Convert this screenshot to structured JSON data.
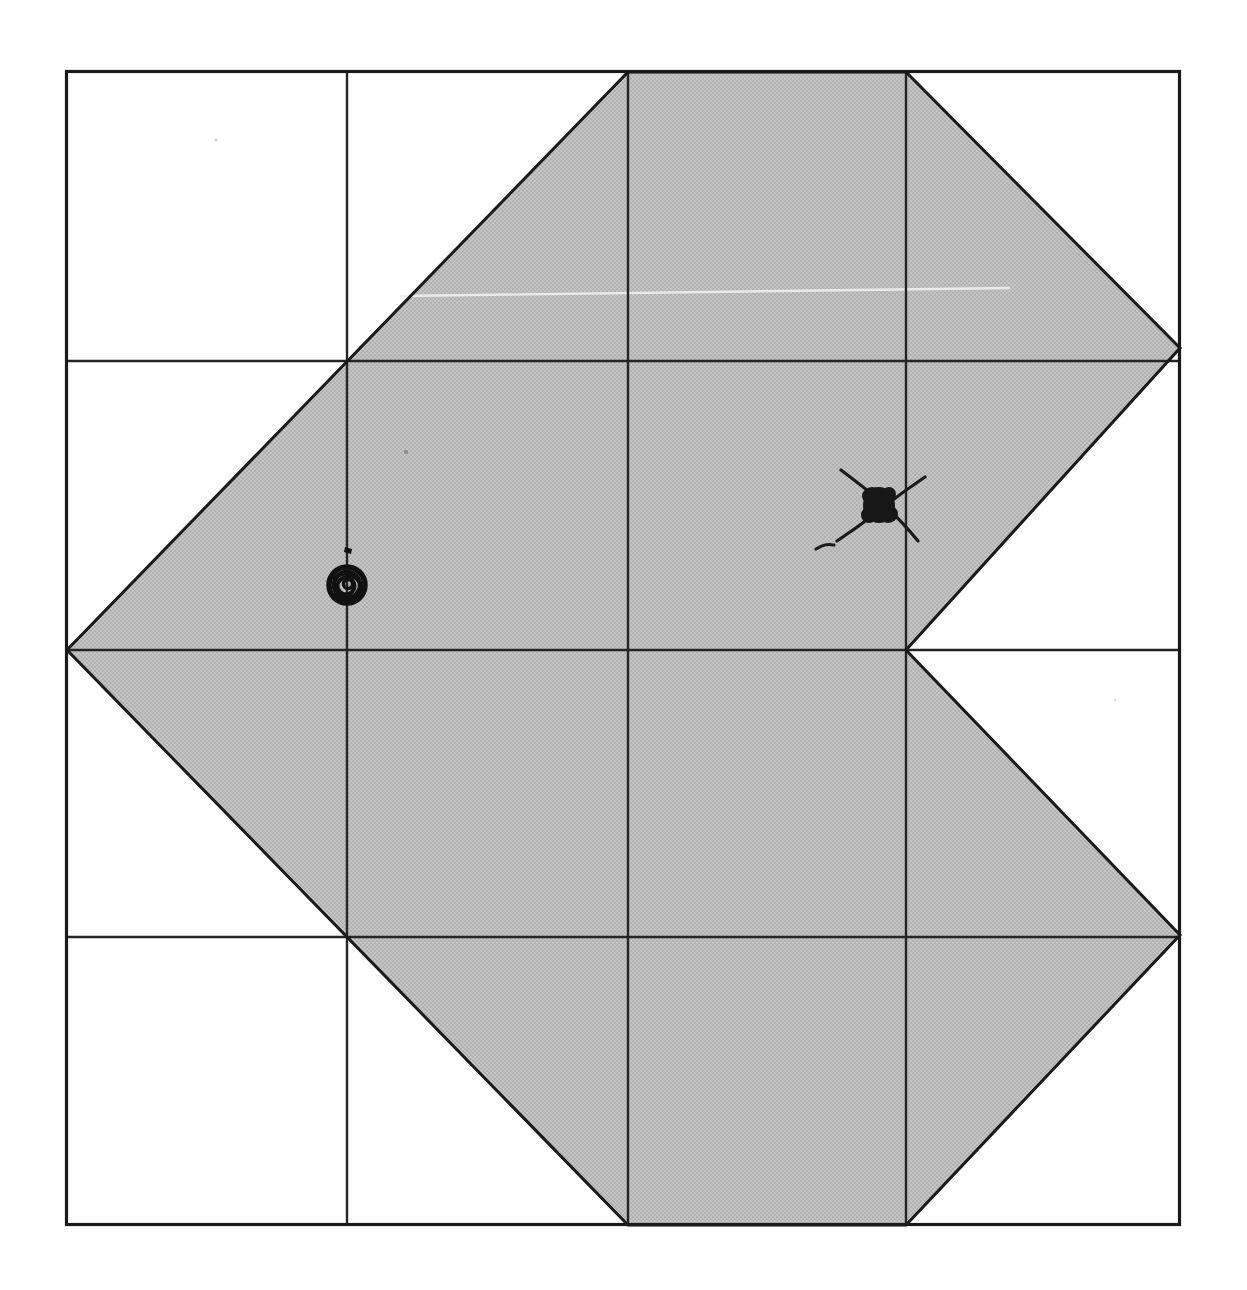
{
  "page": {
    "width": 1247,
    "height": 1290,
    "background_color": "#ffffff",
    "title": "Scanned geometric figure on grid"
  },
  "colors": {
    "background": "#ffffff",
    "ink": "#1a1a1a",
    "grid_line": "#252525",
    "shade_fill": "#bcbcbc",
    "shade_fill_light": "#c6c6c6",
    "shade_stroke": "#1a1a1a",
    "hand_mark": "#111111",
    "scan_artifact": "#f2f2f2",
    "speck": "#9a9a9a"
  },
  "frame": {
    "name": "outer-border",
    "x": 66,
    "y": 71,
    "width": 1114,
    "height": 1154,
    "stroke_width": 3.2
  },
  "grid": {
    "columns": 4,
    "rows": 4,
    "vertical_lines_x": [
      347,
      628,
      906
    ],
    "horizontal_lines_y": [
      361,
      650,
      937
    ],
    "stroke_width": 2.4,
    "cell_width": 279,
    "cell_height": 288
  },
  "shape": {
    "name": "shaded-polygon",
    "description": "Shaded diamond/kite with a V-shaped notch cut into its right side",
    "fill": "#bcbcbc",
    "stroke": "#1a1a1a",
    "stroke_width": 3.0,
    "points": [
      [
        628,
        72
      ],
      [
        906,
        72
      ],
      [
        1180,
        348
      ],
      [
        906,
        650
      ],
      [
        1180,
        935
      ],
      [
        906,
        1225
      ],
      [
        628,
        1225
      ],
      [
        67,
        650
      ]
    ],
    "vertices_labeled": [
      {
        "id": "top-left-flat",
        "x": 628,
        "y": 72
      },
      {
        "id": "top-right-flat",
        "x": 906,
        "y": 72
      },
      {
        "id": "right-upper-point",
        "x": 1180,
        "y": 348
      },
      {
        "id": "notch-apex",
        "x": 906,
        "y": 650
      },
      {
        "id": "right-lower-point",
        "x": 1180,
        "y": 935
      },
      {
        "id": "bottom-right-flat",
        "x": 906,
        "y": 1225
      },
      {
        "id": "bottom-left-flat",
        "x": 628,
        "y": 1225
      },
      {
        "id": "left-point",
        "x": 67,
        "y": 650
      }
    ]
  },
  "interior_lines": [
    {
      "name": "interior-grid-vertical-1",
      "x1": 347,
      "y1": 361,
      "x2": 347,
      "y2": 937
    },
    {
      "name": "interior-grid-vertical-2",
      "x1": 628,
      "y1": 72,
      "x2": 628,
      "y2": 1225
    },
    {
      "name": "interior-grid-vertical-3",
      "x1": 906,
      "y1": 72,
      "x2": 906,
      "y2": 1225
    },
    {
      "name": "interior-grid-horizontal-mid",
      "x1": 67,
      "y1": 650,
      "x2": 1180,
      "y2": 650
    }
  ],
  "annotations": [
    {
      "name": "circle-scribble-mark",
      "type": "filled-circle-scribble",
      "cx": 347,
      "cy": 585,
      "radius": 19,
      "on_feature": "vertical-grid-line-1",
      "color": "#111111"
    },
    {
      "name": "x-cross-mark",
      "type": "x-cross-with-blob",
      "cx": 881,
      "cy": 505,
      "arm_length": 42,
      "blob_radius": 17,
      "on_feature": "near-vertical-grid-line-3",
      "color": "#111111"
    },
    {
      "name": "tick-dot-mark",
      "type": "small-tick",
      "cx": 350,
      "cy": 549,
      "color": "#111111"
    }
  ],
  "scan_artifacts": [
    {
      "name": "horizontal-scan-streak",
      "x1": 400,
      "y1": 296,
      "x2": 1000,
      "y2": 288,
      "color": "#f4f4f4"
    },
    {
      "name": "speck-upper-left",
      "cx": 216,
      "cy": 140,
      "r": 1.6,
      "color": "#c9c9c9"
    },
    {
      "name": "speck-interior",
      "cx": 406,
      "cy": 452,
      "r": 2.0,
      "color": "#8f8f8f"
    },
    {
      "name": "speck-lower-right",
      "cx": 1115,
      "cy": 700,
      "r": 1.4,
      "color": "#dddddd"
    }
  ],
  "chart_data": {
    "type": "diagram",
    "grid_columns": 4,
    "grid_rows": 4,
    "shaded_region_vertices": [
      [
        628,
        72
      ],
      [
        906,
        72
      ],
      [
        1180,
        348
      ],
      [
        906,
        650
      ],
      [
        1180,
        935
      ],
      [
        906,
        1225
      ],
      [
        628,
        1225
      ],
      [
        67,
        650
      ]
    ],
    "marked_points": [
      {
        "label": "circle mark",
        "x": 347,
        "y": 585
      },
      {
        "label": "x mark",
        "x": 881,
        "y": 505
      }
    ]
  }
}
